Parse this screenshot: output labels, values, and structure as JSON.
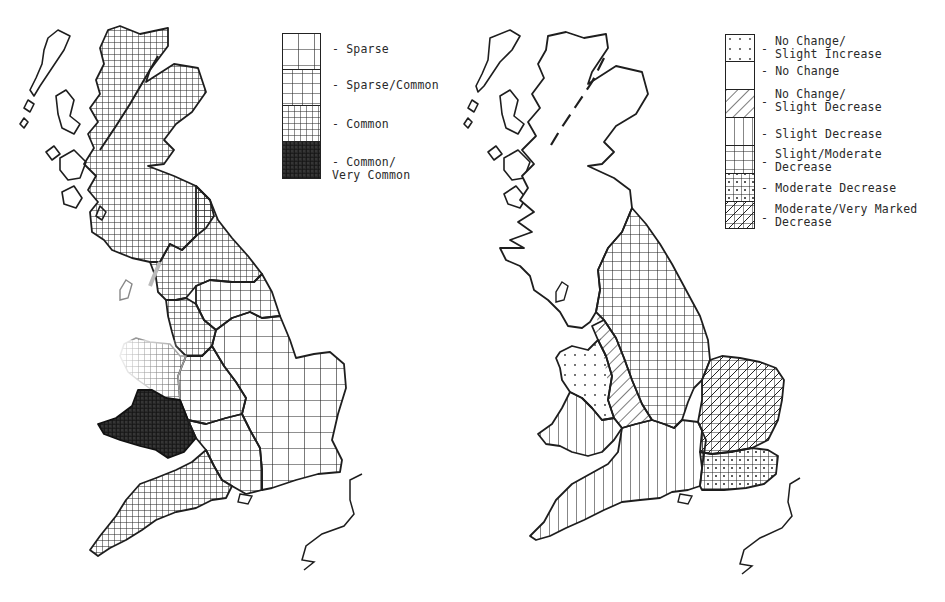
{
  "maps": [
    {
      "id": "left",
      "subject": "Abundance distribution, Great Britain",
      "legend": {
        "title": "",
        "items": [
          {
            "label": "Sparse",
            "pattern": "grid-wide"
          },
          {
            "label": "Sparse/Common",
            "pattern": "grid-medium"
          },
          {
            "label": "Common",
            "pattern": "grid-fine"
          },
          {
            "label": "Common/\nVery Common",
            "pattern": "grid-dense-dark"
          }
        ]
      },
      "regions": [
        {
          "name": "Scotland",
          "category": "Common"
        },
        {
          "name": "North England (Northumberland/Cumbria)",
          "category": "Common"
        },
        {
          "name": "North-West England",
          "category": "Common"
        },
        {
          "name": "Yorkshire",
          "category": "Sparse/Common"
        },
        {
          "name": "Midlands & East Anglia & South-East",
          "category": "Sparse"
        },
        {
          "name": "West Midlands / Welsh Marches",
          "category": "Sparse/Common"
        },
        {
          "name": "North Wales",
          "category": "Common"
        },
        {
          "name": "South Wales",
          "category": "Common/Very Common"
        },
        {
          "name": "South-West England",
          "category": "Common"
        },
        {
          "name": "Central Southern England",
          "category": "Sparse/Common"
        }
      ]
    },
    {
      "id": "right",
      "subject": "Population change, Great Britain",
      "legend": {
        "title": "",
        "items": [
          {
            "label": "No Change/\nSlight Increase",
            "pattern": "dots"
          },
          {
            "label": "No Change",
            "pattern": "blank"
          },
          {
            "label": "No Change/\nSlight Decrease",
            "pattern": "diagonal"
          },
          {
            "label": "Slight Decrease",
            "pattern": "vertical"
          },
          {
            "label": "Slight/Moderate\nDecrease",
            "pattern": "grid"
          },
          {
            "label": "Moderate Decrease",
            "pattern": "grid-dots"
          },
          {
            "label": "Moderate/Very Marked\nDecrease",
            "pattern": "grid-diagonal"
          }
        ]
      },
      "regions": [
        {
          "name": "Scotland",
          "category": "No Change"
        },
        {
          "name": "North-West England",
          "category": "No Change"
        },
        {
          "name": "North-East England & Yorkshire & East Midlands",
          "category": "Slight/Moderate Decrease"
        },
        {
          "name": "West Midlands",
          "category": "No Change/Slight Decrease"
        },
        {
          "name": "North & Mid Wales",
          "category": "No Change/Slight Increase"
        },
        {
          "name": "South Wales",
          "category": "Slight Decrease"
        },
        {
          "name": "South-West & Southern England",
          "category": "Slight Decrease"
        },
        {
          "name": "East Anglia",
          "category": "Moderate/Very Marked Decrease"
        },
        {
          "name": "South-East England",
          "category": "Moderate Decrease"
        }
      ]
    }
  ],
  "colors": {
    "ink": "#1e1e1e",
    "paper": "#ffffff"
  }
}
